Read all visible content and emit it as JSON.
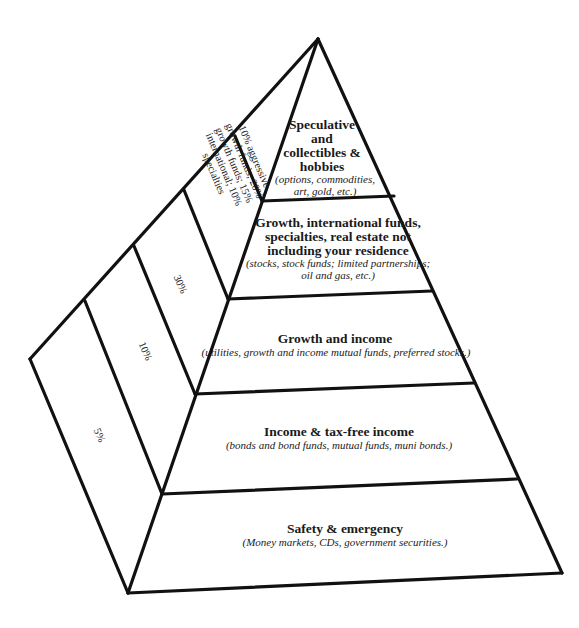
{
  "diagram": {
    "type": "investment-pyramid",
    "levels": [
      {
        "title_lines": [
          "Speculative",
          "and",
          "collectibles &",
          "hobbies"
        ],
        "detail_lines": [
          "(options, commodities,",
          "art, gold, etc.)"
        ],
        "side_label_lines": [
          "10% aggressive",
          "growth funds; 20%",
          "growth funds; 15%",
          "international; 10%",
          "specialties"
        ]
      },
      {
        "title_lines": [
          "Growth, international funds,",
          "specialties, real estate not",
          "including your residence"
        ],
        "detail_lines": [
          "(stocks, stock funds; limited partnerships;",
          "oil and gas, etc.)"
        ],
        "side_label": "30%"
      },
      {
        "title": "Growth and income",
        "detail": "(utilities, growth and income mutual funds, preferred stocks.)",
        "side_label": "10%"
      },
      {
        "title": "Income & tax-free income",
        "detail": "(bonds and bond funds, mutual funds, muni bonds.)",
        "side_label": "5%"
      },
      {
        "title": "Safety & emergency",
        "detail": "(Money markets, CDs, government securities.)"
      }
    ],
    "colors": {
      "line": "#111111",
      "background": "#ffffff",
      "text": "#1a1a1a"
    }
  }
}
